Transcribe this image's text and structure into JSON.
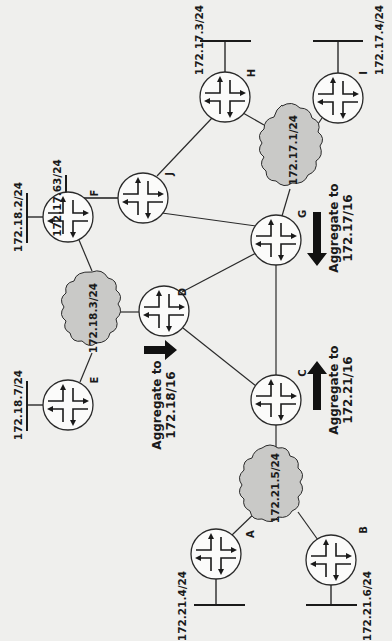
{
  "diagram": {
    "colors": {
      "background": "#efefed",
      "cloud_fill": "#c9c9c7",
      "ink": "#1a1a1a"
    },
    "routers": [
      {
        "id": "A",
        "label": "A",
        "icon": "router-icon"
      },
      {
        "id": "B",
        "label": "B",
        "icon": "router-icon"
      },
      {
        "id": "C",
        "label": "C",
        "icon": "router-icon"
      },
      {
        "id": "D",
        "label": "D",
        "icon": "router-icon"
      },
      {
        "id": "E",
        "label": "E",
        "icon": "router-icon"
      },
      {
        "id": "F",
        "label": "F",
        "icon": "router-icon"
      },
      {
        "id": "G",
        "label": "G",
        "icon": "router-icon"
      },
      {
        "id": "H",
        "label": "H",
        "icon": "router-icon"
      },
      {
        "id": "I",
        "label": "I",
        "icon": "router-icon"
      },
      {
        "id": "J",
        "label": "J",
        "icon": "router-icon"
      }
    ],
    "clouds": [
      {
        "id": "net-172-18-3",
        "label": "172.18.3/24",
        "icon": "cloud-icon"
      },
      {
        "id": "net-172-21-5",
        "label": "172.21.5/24",
        "icon": "cloud-icon"
      },
      {
        "id": "net-172-17-1",
        "label": "172.17.1/24",
        "icon": "cloud-icon"
      }
    ],
    "stub_networks": [
      {
        "router": "A",
        "label": "172.21.4/24"
      },
      {
        "router": "B",
        "label": "172.21.6/24"
      },
      {
        "router": "E",
        "label": "172.18.7/24"
      },
      {
        "router": "F",
        "label": "172.18.2/24"
      },
      {
        "router": "H",
        "label": "172.17.3/24"
      },
      {
        "router": "I",
        "label": "172.17.4/24"
      },
      {
        "router": "J",
        "label": "172.17.63/24"
      }
    ],
    "links": [
      [
        "A",
        "net-172-21-5"
      ],
      [
        "B",
        "net-172-21-5"
      ],
      [
        "C",
        "net-172-21-5"
      ],
      [
        "C",
        "D"
      ],
      [
        "C",
        "G"
      ],
      [
        "D",
        "G"
      ],
      [
        "D",
        "net-172-18-3"
      ],
      [
        "E",
        "net-172-18-3"
      ],
      [
        "F",
        "net-172-18-3"
      ],
      [
        "G",
        "J"
      ],
      [
        "G",
        "net-172-17-1"
      ],
      [
        "J",
        "H"
      ],
      [
        "H",
        "net-172-17-1"
      ],
      [
        "I",
        "net-172-17-1"
      ]
    ],
    "aggregations": [
      {
        "router": "D",
        "line1": "Aggregate to",
        "line2": "172.18/16",
        "direction": "toward D"
      },
      {
        "router": "C",
        "line1": "Aggregate to",
        "line2": "172.21/16",
        "direction": "toward C"
      },
      {
        "router": "G",
        "line1": "Aggregate to",
        "line2": "172.17/16",
        "direction": "toward G"
      }
    ]
  }
}
